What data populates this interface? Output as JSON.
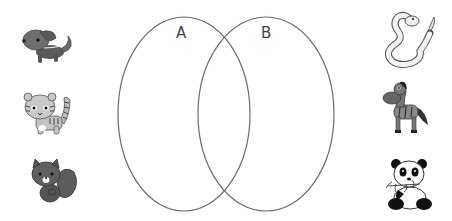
{
  "diagram": {
    "type": "venn",
    "sets": [
      {
        "id": "A",
        "label": "A",
        "cx": 184,
        "cy": 114,
        "rx": 66,
        "ry": 97
      },
      {
        "id": "B",
        "label": "B",
        "cx": 266,
        "cy": 114,
        "rx": 68,
        "ry": 97
      }
    ],
    "stroke_color": "#6b6b6b"
  },
  "left_animals": [
    {
      "name": "dog"
    },
    {
      "name": "tiger-cat"
    },
    {
      "name": "squirrel"
    }
  ],
  "right_animals": [
    {
      "name": "snake"
    },
    {
      "name": "zebra"
    },
    {
      "name": "panda"
    }
  ]
}
